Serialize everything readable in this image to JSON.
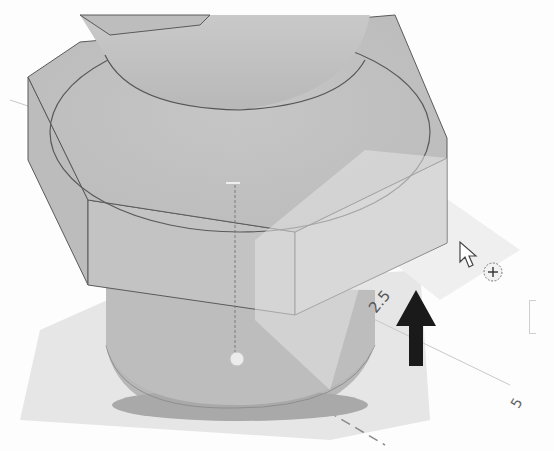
{
  "viewport": {
    "model": "hex-bolt-with-washer",
    "dimensions": [
      {
        "id": "radial",
        "text": "2.5"
      },
      {
        "id": "grid-axis",
        "text": "5"
      }
    ],
    "manipulator": {
      "icon": "push-pull-arrow-up",
      "color": "#1a1a1a"
    },
    "cursor": {
      "icon": "arrow-cursor-with-move-badge"
    }
  },
  "colors": {
    "body": "#c4c4c4",
    "body_dark": "#b3b3b3",
    "edge": "#5a5a5a",
    "ground_shadow": "#e3e3e3",
    "highlight_plane": "#d9d9d9"
  }
}
